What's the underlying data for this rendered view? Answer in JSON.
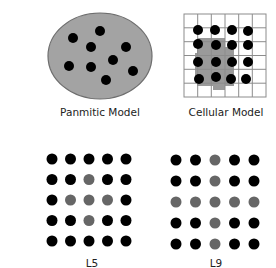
{
  "figure": {
    "panels": [
      {
        "id": "panmitic",
        "label": "Panmitic Model",
        "shape": "ellipse",
        "fill_color": "#a3a3a3",
        "stroke_color": "#6e6e6e",
        "individuals": 9
      },
      {
        "id": "cellular",
        "label": "Cellular Model",
        "shape": "grid",
        "grid_size": "6x6",
        "individuals": 16,
        "neighborhood_fill": "#9a9a9a"
      },
      {
        "id": "l5",
        "label": "L5",
        "shape": "dot-lattice",
        "rows": 5,
        "cols": 5,
        "pattern": [
          [
            0,
            0,
            0,
            0,
            0
          ],
          [
            0,
            0,
            1,
            0,
            0
          ],
          [
            0,
            1,
            1,
            1,
            0
          ],
          [
            0,
            0,
            1,
            0,
            0
          ],
          [
            0,
            0,
            0,
            0,
            0
          ]
        ]
      },
      {
        "id": "l9",
        "label": "L9",
        "shape": "dot-lattice",
        "rows": 5,
        "cols": 5,
        "pattern": [
          [
            0,
            0,
            1,
            0,
            0
          ],
          [
            0,
            0,
            1,
            0,
            0
          ],
          [
            1,
            1,
            1,
            1,
            1
          ],
          [
            0,
            0,
            1,
            0,
            0
          ],
          [
            0,
            0,
            1,
            0,
            0
          ]
        ]
      }
    ],
    "colors": {
      "individual": "#000000",
      "neighbor": "#666666",
      "grid_line": "#8c8c8c"
    }
  }
}
